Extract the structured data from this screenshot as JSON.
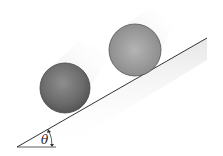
{
  "diagram": {
    "angle_label": "θ",
    "objects": [
      {
        "name": "sphere",
        "cx": 65,
        "cy": 88,
        "r": 25
      },
      {
        "name": "disc",
        "cx": 135,
        "cy": 50,
        "r": 26
      }
    ],
    "incline": {
      "x1": 17,
      "y1": 147,
      "x2": 207,
      "y2": 38
    },
    "colors": {
      "line": "#333333",
      "sphere": "#6e6e6e",
      "disc": "#9a9a9a",
      "shadow": "#d8d8d8"
    }
  }
}
